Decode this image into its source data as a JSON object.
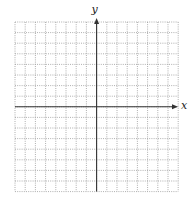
{
  "chart_data": {
    "type": "scatter",
    "title": "",
    "xlabel": "x",
    "ylabel": "y",
    "xlim": [
      -8,
      8
    ],
    "ylim": [
      -8,
      8
    ],
    "grid": true,
    "grid_style": "dotted",
    "tick_labels": false,
    "series": []
  },
  "colors": {
    "axis": "#333333",
    "grid": "#9a9a9a",
    "background": "#ffffff"
  },
  "layout": {
    "grid_left": 15,
    "grid_top": 22,
    "cell_w": 10.2,
    "cell_h": 10.6,
    "cols": 16,
    "rows": 16,
    "x_axis_end": 178,
    "y_axis_top": 18
  }
}
